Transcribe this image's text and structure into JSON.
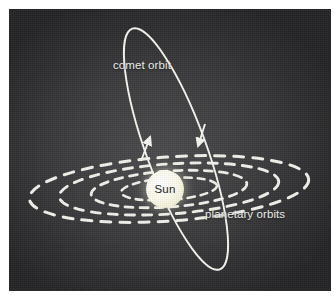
{
  "figure": {
    "kind": "astronomy-diagram",
    "background_color": "#3b3b3d",
    "frame_color": "#ffffff",
    "stroke_color": "#f5f5ef"
  },
  "labels": {
    "comet_orbit": "comet orbit",
    "planetary_orbits": "planetary orbits",
    "sun": "Sun"
  },
  "sun": {
    "label": "Sun",
    "color": "#f9f6e2",
    "text_color": "#16161a",
    "center_x": 156,
    "center_y": 180,
    "radius": 19
  },
  "comet_orbit": {
    "style": "solid",
    "color": "#f7f7f1",
    "semi_major": 128,
    "semi_minor": 30,
    "tilt_degrees": -20,
    "center_x": 167,
    "center_y": 140,
    "direction_arrows": 2,
    "arrow_left_direction": "up",
    "arrow_right_direction": "down"
  },
  "planetary_orbits": {
    "style": "dashed",
    "color": "#f2f2ec",
    "count": 4,
    "tilt_degrees": -4,
    "center_x": 160,
    "center_y": 180,
    "rings": [
      {
        "semi_major": 48,
        "semi_minor": 11
      },
      {
        "semi_major": 78,
        "semi_minor": 18
      },
      {
        "semi_major": 110,
        "semi_minor": 25
      },
      {
        "semi_major": 140,
        "semi_minor": 32
      }
    ]
  }
}
